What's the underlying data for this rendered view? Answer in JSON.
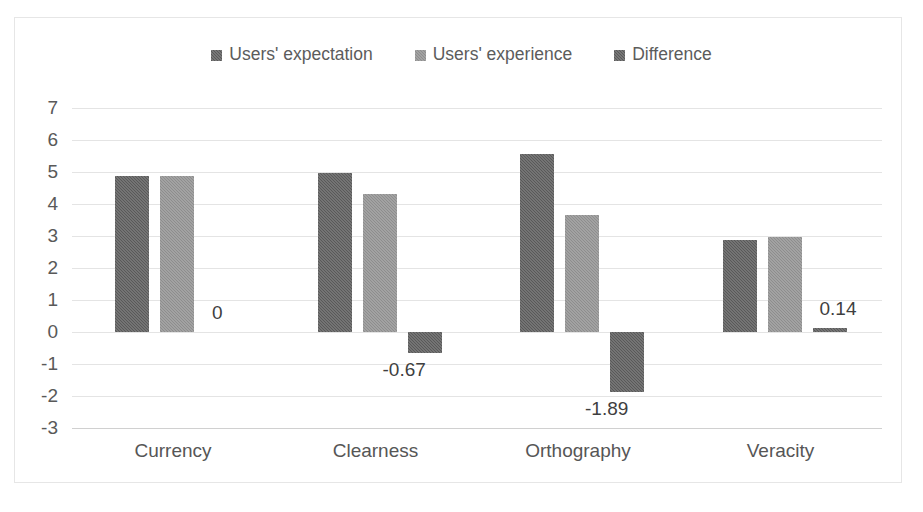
{
  "chart_data": {
    "type": "bar",
    "title": "",
    "subtitle": "",
    "xlabel": "",
    "ylabel": "",
    "categories": [
      "Currency",
      "Clearness",
      "Orthography",
      "Veracity"
    ],
    "series": [
      {
        "name": "Users' expectation",
        "color": "#595959",
        "values": [
          4.88,
          4.97,
          5.55,
          2.86
        ]
      },
      {
        "name": "Users' experience",
        "color": "#8d8d8d",
        "values": [
          4.88,
          4.3,
          3.65,
          2.96
        ]
      },
      {
        "name": "Difference",
        "color": "#595959",
        "values": [
          0,
          -0.67,
          -1.89,
          0.14
        ]
      }
    ],
    "data_labels": [
      "0",
      "-0.67",
      "-1.89",
      "0.14"
    ],
    "ylim": [
      -3,
      7
    ],
    "ytick_step": 1,
    "yticks": [
      "7",
      "6",
      "5",
      "4",
      "3",
      "2",
      "1",
      "0",
      "-1",
      "-2",
      "-3"
    ],
    "grid": true,
    "legend_position": "top"
  },
  "legend": {
    "items": [
      {
        "label": "Users' expectation",
        "swatch": "#595959"
      },
      {
        "label": "Users' experience",
        "swatch": "#8d8d8d"
      },
      {
        "label": "Difference",
        "swatch": "#595959"
      }
    ]
  }
}
